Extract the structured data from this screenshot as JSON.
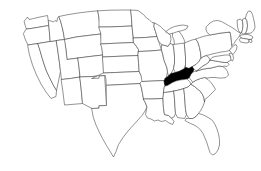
{
  "figure": {
    "type": "choropleth-locator-map",
    "region": "Contiguous United States",
    "caption": "",
    "background_color": "#ffffff",
    "outline_color": "#3a3a3a",
    "highlight_color": "#000000",
    "default_state_fill": "#ffffff"
  },
  "legend": {
    "visible": false,
    "entries": [
      {
        "label": "Highlighted state",
        "color": "#000000"
      },
      {
        "label": "Other states",
        "color": "#ffffff"
      }
    ]
  },
  "highlighted_states": [
    {
      "code": "KY",
      "name": "Kentucky"
    }
  ],
  "states": [
    {
      "code": "WA",
      "name": "Washington",
      "highlighted": false
    },
    {
      "code": "OR",
      "name": "Oregon",
      "highlighted": false
    },
    {
      "code": "CA",
      "name": "California",
      "highlighted": false
    },
    {
      "code": "NV",
      "name": "Nevada",
      "highlighted": false
    },
    {
      "code": "ID",
      "name": "Idaho",
      "highlighted": false
    },
    {
      "code": "MT",
      "name": "Montana",
      "highlighted": false
    },
    {
      "code": "WY",
      "name": "Wyoming",
      "highlighted": false
    },
    {
      "code": "UT",
      "name": "Utah",
      "highlighted": false
    },
    {
      "code": "AZ",
      "name": "Arizona",
      "highlighted": false
    },
    {
      "code": "NM",
      "name": "New Mexico",
      "highlighted": false
    },
    {
      "code": "CO",
      "name": "Colorado",
      "highlighted": false
    },
    {
      "code": "ND",
      "name": "North Dakota",
      "highlighted": false
    },
    {
      "code": "SD",
      "name": "South Dakota",
      "highlighted": false
    },
    {
      "code": "NE",
      "name": "Nebraska",
      "highlighted": false
    },
    {
      "code": "KS",
      "name": "Kansas",
      "highlighted": false
    },
    {
      "code": "OK",
      "name": "Oklahoma",
      "highlighted": false
    },
    {
      "code": "TX",
      "name": "Texas",
      "highlighted": false
    },
    {
      "code": "MN",
      "name": "Minnesota",
      "highlighted": false
    },
    {
      "code": "IA",
      "name": "Iowa",
      "highlighted": false
    },
    {
      "code": "MO",
      "name": "Missouri",
      "highlighted": false
    },
    {
      "code": "AR",
      "name": "Arkansas",
      "highlighted": false
    },
    {
      "code": "LA",
      "name": "Louisiana",
      "highlighted": false
    },
    {
      "code": "WI",
      "name": "Wisconsin",
      "highlighted": false
    },
    {
      "code": "IL",
      "name": "Illinois",
      "highlighted": false
    },
    {
      "code": "MI",
      "name": "Michigan",
      "highlighted": false
    },
    {
      "code": "IN",
      "name": "Indiana",
      "highlighted": false
    },
    {
      "code": "OH",
      "name": "Ohio",
      "highlighted": false
    },
    {
      "code": "KY",
      "name": "Kentucky",
      "highlighted": true
    },
    {
      "code": "TN",
      "name": "Tennessee",
      "highlighted": false
    },
    {
      "code": "MS",
      "name": "Mississippi",
      "highlighted": false
    },
    {
      "code": "AL",
      "name": "Alabama",
      "highlighted": false
    },
    {
      "code": "GA",
      "name": "Georgia",
      "highlighted": false
    },
    {
      "code": "FL",
      "name": "Florida",
      "highlighted": false
    },
    {
      "code": "SC",
      "name": "South Carolina",
      "highlighted": false
    },
    {
      "code": "NC",
      "name": "North Carolina",
      "highlighted": false
    },
    {
      "code": "VA",
      "name": "Virginia",
      "highlighted": false
    },
    {
      "code": "WV",
      "name": "West Virginia",
      "highlighted": false
    },
    {
      "code": "MD",
      "name": "Maryland",
      "highlighted": false
    },
    {
      "code": "DE",
      "name": "Delaware",
      "highlighted": false
    },
    {
      "code": "PA",
      "name": "Pennsylvania",
      "highlighted": false
    },
    {
      "code": "NJ",
      "name": "New Jersey",
      "highlighted": false
    },
    {
      "code": "NY",
      "name": "New York",
      "highlighted": false
    },
    {
      "code": "CT",
      "name": "Connecticut",
      "highlighted": false
    },
    {
      "code": "RI",
      "name": "Rhode Island",
      "highlighted": false
    },
    {
      "code": "MA",
      "name": "Massachusetts",
      "highlighted": false
    },
    {
      "code": "VT",
      "name": "Vermont",
      "highlighted": false
    },
    {
      "code": "NH",
      "name": "New Hampshire",
      "highlighted": false
    },
    {
      "code": "ME",
      "name": "Maine",
      "highlighted": false
    }
  ]
}
